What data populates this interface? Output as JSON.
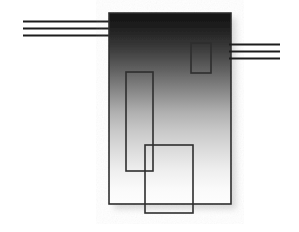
{
  "figure": {
    "canvas": {
      "width": 299,
      "height": 232,
      "background": "#ffffff"
    },
    "colors": {
      "background": "#ffffff",
      "gradient_top": "#191919",
      "gradient_mid": "#c6c6c6",
      "gradient_bottom": "#fbfbfb",
      "stroke": "#2e2e2e",
      "line": "#1c1c1c",
      "shadow": "#d9d9d9"
    },
    "body": {
      "name": "main-gradient-body",
      "x": 109,
      "y": 13,
      "width": 122,
      "height": 191,
      "fill": "vertical-gradient-dark-to-white",
      "stroke": "#2e2e2e",
      "stroke_width": 1.6
    },
    "shadow": {
      "name": "drop-shadow",
      "x": 114,
      "y": 18,
      "width": 122,
      "height": 191,
      "fill": "#d9d9d9",
      "blur": 4
    },
    "left_lines": {
      "name": "left-connector-lines",
      "count": 3,
      "x_start": 23,
      "x_end": 110,
      "stroke_width": 2.2,
      "color": "#1c1c1c",
      "y_values": [
        21,
        28,
        35
      ]
    },
    "right_lines": {
      "name": "right-connector-lines",
      "count": 3,
      "x_start": 229,
      "x_end": 280,
      "stroke_width": 2.2,
      "color": "#1c1c1c",
      "y_values": [
        44,
        51,
        58
      ]
    },
    "inner_rects": [
      {
        "name": "small-upper-right-rect",
        "x": 191,
        "y": 43,
        "width": 20,
        "height": 30,
        "fill": "none",
        "stroke": "#2e2e2e",
        "stroke_width": 1.6
      },
      {
        "name": "tall-left-rect",
        "x": 126,
        "y": 72,
        "width": 27,
        "height": 99,
        "fill": "none",
        "stroke": "#2e2e2e",
        "stroke_width": 1.6
      },
      {
        "name": "lower-overlap-rect",
        "x": 145,
        "y": 145,
        "width": 48,
        "height": 68,
        "fill": "none",
        "stroke": "#2e2e2e",
        "stroke_width": 1.6
      }
    ]
  }
}
